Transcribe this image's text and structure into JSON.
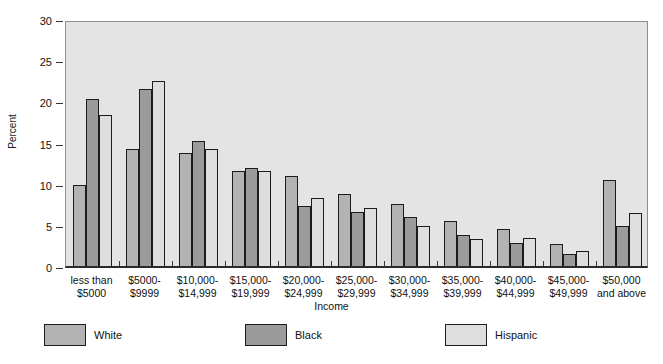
{
  "chart_data": {
    "type": "bar",
    "title": "",
    "xlabel": "Income",
    "ylabel": "Percent",
    "ylim": [
      0,
      30
    ],
    "yticks": [
      0,
      5,
      10,
      15,
      20,
      25,
      30
    ],
    "grid": false,
    "legend_position": "bottom",
    "categories": [
      "less than\n$5000",
      "$5000-\n$9999",
      "$10,000-\n$14,999",
      "$15,000-\n$19,999",
      "$20,000-\n$24,999",
      "$25,000-\n$29,999",
      "$30,000-\n$34,999",
      "$35,000-\n$39,999",
      "$40,000-\n$44,999",
      "$45,000-\n$49,999",
      "$50,000\nand above"
    ],
    "category_lines": [
      [
        "less than",
        "$5000"
      ],
      [
        "$5000-",
        "$9999"
      ],
      [
        "$10,000-",
        "$14,999"
      ],
      [
        "$15,000-",
        "$19,999"
      ],
      [
        "$20,000-",
        "$24,999"
      ],
      [
        "$25,000-",
        "$29,999"
      ],
      [
        "$30,000-",
        "$34,999"
      ],
      [
        "$35,000-",
        "$39,999"
      ],
      [
        "$40,000-",
        "$44,999"
      ],
      [
        "$45,000-",
        "$49,999"
      ],
      [
        "$50,000",
        "and above"
      ]
    ],
    "series": [
      {
        "name": "White",
        "color": "#b3b3b3",
        "values": [
          9.8,
          14.2,
          13.7,
          11.6,
          10.9,
          8.7,
          7.5,
          5.5,
          4.5,
          2.7,
          10.4
        ]
      },
      {
        "name": "Black",
        "color": "#9b9b9b",
        "values": [
          20.3,
          21.5,
          15.2,
          11.9,
          7.3,
          6.6,
          6.0,
          3.8,
          2.8,
          1.5,
          4.8
        ]
      },
      {
        "name": "Hispanic",
        "color": "#dedede",
        "values": [
          18.3,
          22.5,
          14.2,
          11.5,
          8.3,
          7.1,
          4.8,
          3.3,
          3.4,
          1.8,
          6.4
        ]
      }
    ]
  },
  "legend": {
    "items": [
      {
        "label": "White",
        "color": "#b3b3b3"
      },
      {
        "label": "Black",
        "color": "#9b9b9b"
      },
      {
        "label": "Hispanic",
        "color": "#dedede"
      }
    ]
  },
  "colors": {
    "plot_background": "#e4e4e4",
    "page_background": "#ffffff",
    "bar_outline": "#1c1c1c",
    "axis": "#2b2b2b",
    "text": "#111111"
  }
}
